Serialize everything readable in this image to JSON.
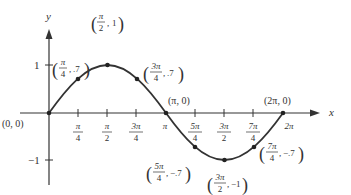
{
  "axes": {
    "x_label": "x",
    "y_label": "y",
    "y_ticks": [
      {
        "label": "1",
        "value": 1
      },
      {
        "label": "−1",
        "value": -1
      }
    ],
    "x_ticks": [
      {
        "num": "π",
        "den": "4",
        "value": 0.25
      },
      {
        "num": "π",
        "den": "2",
        "value": 0.5
      },
      {
        "num": "3π",
        "den": "4",
        "value": 0.75
      },
      {
        "num": "π",
        "den": "",
        "value": 1.0
      },
      {
        "num": "5π",
        "den": "4",
        "value": 1.25
      },
      {
        "num": "3π",
        "den": "2",
        "value": 1.5
      },
      {
        "num": "7π",
        "den": "4",
        "value": 1.75
      },
      {
        "num": "2π",
        "den": "",
        "value": 2.0
      }
    ]
  },
  "curve": {
    "function": "y = sin x",
    "domain": "[0, 2π]",
    "color": "#333333"
  },
  "points": [
    {
      "id": "origin",
      "label": "(0, 0)"
    },
    {
      "id": "pi4",
      "num": "π",
      "den": "4",
      "y": ".7"
    },
    {
      "id": "pi2",
      "num": "π",
      "den": "2",
      "y": "1"
    },
    {
      "id": "3pi4",
      "num": "3π",
      "den": "4",
      "y": ".7"
    },
    {
      "id": "pi",
      "label": "(π, 0)"
    },
    {
      "id": "5pi4",
      "num": "5π",
      "den": "4",
      "y": "−.7"
    },
    {
      "id": "3pi2",
      "num": "3π",
      "den": "2",
      "y": "−1"
    },
    {
      "id": "7pi4",
      "num": "7π",
      "den": "4",
      "y": "−.7"
    },
    {
      "id": "2pi",
      "label": "(2π, 0)"
    }
  ]
}
